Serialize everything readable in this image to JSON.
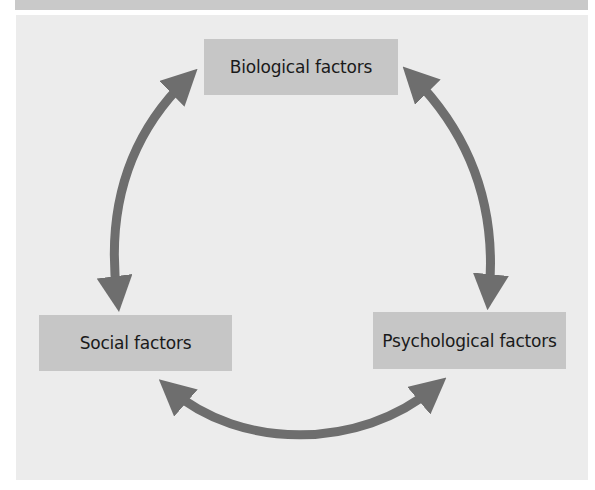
{
  "diagram": {
    "type": "cycle",
    "nodes": [
      {
        "id": "biological",
        "label": "Biological factors"
      },
      {
        "id": "social",
        "label": "Social factors"
      },
      {
        "id": "psychological",
        "label": "Psychological factors"
      }
    ],
    "edges": [
      {
        "from": "biological",
        "to": "social",
        "bidirectional": true
      },
      {
        "from": "biological",
        "to": "psychological",
        "bidirectional": true
      },
      {
        "from": "social",
        "to": "psychological",
        "bidirectional": true
      }
    ],
    "colors": {
      "panel": "#ececec",
      "box": "#c6c6c6",
      "arrow": "#6e6e6e",
      "top_band": "#c9c9c9",
      "text": "#1a1a1a"
    }
  }
}
